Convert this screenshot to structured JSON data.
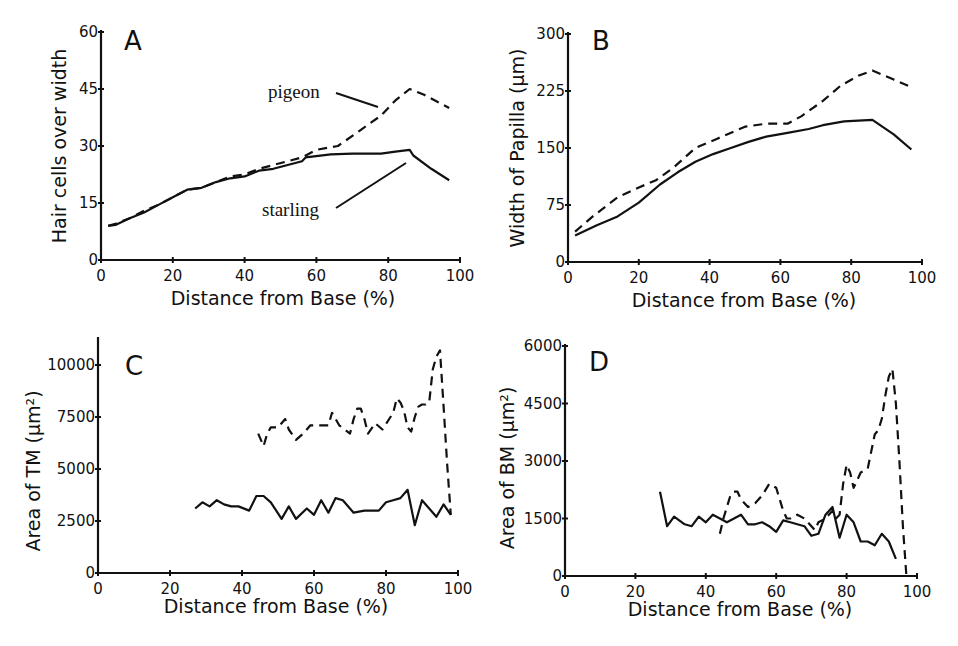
{
  "chart_data": [
    {
      "panel": "A",
      "type": "line",
      "title": "A",
      "xlabel": "Distance from Base (%)",
      "ylabel": "Hair cells over width",
      "xlim": [
        0,
        100
      ],
      "ylim": [
        0,
        60
      ],
      "xticks": [
        0,
        20,
        40,
        60,
        80,
        100
      ],
      "yticks": [
        0,
        15,
        30,
        45,
        60
      ],
      "grid": false,
      "legend": "inline annotations",
      "annotations": [
        "pigeon",
        "starling"
      ],
      "series": [
        {
          "name": "pigeon",
          "style": "dashed",
          "x": [
            2,
            4,
            8,
            12,
            16,
            20,
            24,
            28,
            32,
            36,
            40,
            44,
            48,
            52,
            56,
            60,
            66,
            72,
            78,
            82,
            86,
            90,
            97
          ],
          "y": [
            9,
            9.5,
            11,
            13,
            14.5,
            16.5,
            18.5,
            19,
            20.5,
            22,
            22.5,
            24,
            25,
            26,
            27,
            29,
            30,
            34,
            38,
            42,
            45,
            43.5,
            40
          ]
        },
        {
          "name": "starling",
          "style": "solid",
          "x": [
            2,
            4,
            8,
            12,
            16,
            20,
            24,
            28,
            32,
            36,
            40,
            44,
            48,
            52,
            56,
            57,
            64,
            70,
            78,
            82,
            86,
            87,
            92,
            97
          ],
          "y": [
            9,
            9.2,
            11,
            12.5,
            14.5,
            16.5,
            18.5,
            19,
            20.5,
            21.5,
            22,
            23.5,
            24,
            25,
            26,
            27,
            27.8,
            28,
            28,
            28.5,
            29,
            27.5,
            24,
            21
          ]
        }
      ]
    },
    {
      "panel": "B",
      "type": "line",
      "title": "B",
      "xlabel": "Distance from Base (%)",
      "ylabel": "Width of Papilla (μm)",
      "xlim": [
        0,
        100
      ],
      "ylim": [
        0,
        300
      ],
      "xticks": [
        0,
        20,
        40,
        60,
        80,
        100
      ],
      "yticks": [
        0,
        75,
        150,
        225,
        300
      ],
      "grid": false,
      "series": [
        {
          "name": "pigeon",
          "style": "dashed",
          "x": [
            2,
            7,
            14,
            20,
            25,
            30,
            36,
            42,
            50,
            56,
            62,
            66,
            72,
            77,
            82,
            86,
            92,
            97
          ],
          "y": [
            40,
            60,
            85,
            98,
            108,
            125,
            150,
            162,
            178,
            182,
            182,
            192,
            212,
            232,
            245,
            252,
            240,
            230
          ]
        },
        {
          "name": "starling",
          "style": "solid",
          "x": [
            2,
            8,
            14,
            20,
            26,
            31,
            36,
            41,
            46,
            51,
            56,
            62,
            68,
            72,
            78,
            82,
            86,
            92,
            97
          ],
          "y": [
            35,
            48,
            60,
            78,
            102,
            118,
            132,
            142,
            150,
            158,
            165,
            170,
            175,
            180,
            185,
            186,
            187,
            168,
            148
          ]
        }
      ]
    },
    {
      "panel": "C",
      "type": "line",
      "title": "C",
      "xlabel": "Distance from Base (%)",
      "ylabel": "Area of TM (μm²)",
      "xlim": [
        0,
        100
      ],
      "ylim": [
        0,
        11000
      ],
      "xticks": [
        0,
        20,
        40,
        60,
        80,
        100
      ],
      "yticks": [
        0,
        2500,
        5000,
        7500,
        10000
      ],
      "grid": false,
      "series": [
        {
          "name": "pigeon",
          "style": "dashed",
          "x": [
            44.5,
            46,
            47,
            48,
            50,
            51,
            52,
            53,
            55,
            57,
            59,
            62,
            64,
            65,
            67,
            70,
            71,
            72,
            73,
            74,
            75,
            77,
            79,
            82,
            83,
            84,
            85,
            86,
            87,
            88,
            89,
            90,
            91,
            92,
            93,
            94,
            95,
            96,
            97,
            98
          ],
          "y": [
            6700,
            6100,
            6700,
            7000,
            7000,
            7200,
            7400,
            6900,
            6400,
            6700,
            7100,
            7100,
            7100,
            7700,
            7100,
            6700,
            7400,
            7900,
            7900,
            7400,
            6700,
            7200,
            6900,
            7700,
            8400,
            8200,
            7800,
            7000,
            6800,
            7500,
            8000,
            8100,
            8100,
            8200,
            9800,
            10400,
            10700,
            8000,
            5200,
            2800
          ]
        },
        {
          "name": "starling",
          "style": "solid",
          "x": [
            27,
            29,
            31,
            33,
            35,
            37,
            39,
            42,
            44,
            46,
            48,
            51,
            53,
            55,
            58,
            60,
            62,
            64,
            66,
            68,
            71,
            74,
            76,
            78,
            80,
            82,
            84,
            86,
            88,
            90,
            92,
            94,
            96,
            98
          ],
          "y": [
            3100,
            3400,
            3200,
            3500,
            3300,
            3200,
            3200,
            3000,
            3700,
            3700,
            3400,
            2600,
            3200,
            2600,
            3100,
            2800,
            3500,
            2900,
            3600,
            3500,
            2900,
            3000,
            3000,
            3000,
            3400,
            3500,
            3600,
            4000,
            2300,
            3500,
            3100,
            2700,
            3300,
            2800
          ]
        }
      ]
    },
    {
      "panel": "D",
      "type": "line",
      "title": "D",
      "xlabel": "Distance from Base (%)",
      "ylabel": "Area of BM (μm²)",
      "xlim": [
        0,
        100
      ],
      "ylim": [
        0,
        6000
      ],
      "xticks": [
        0,
        20,
        40,
        60,
        80,
        100
      ],
      "yticks": [
        0,
        1500,
        3000,
        4500,
        6000
      ],
      "grid": false,
      "series": [
        {
          "name": "pigeon",
          "style": "dashed",
          "x": [
            44,
            45,
            46,
            47,
            48,
            49,
            50,
            51,
            52,
            54,
            56,
            58,
            60,
            61,
            62,
            63,
            64,
            66,
            68,
            70,
            71,
            72,
            74,
            76,
            77,
            78,
            79,
            80,
            81,
            82,
            83,
            84,
            86,
            88,
            89,
            90,
            91,
            92,
            93,
            94,
            95,
            96,
            97
          ],
          "y": [
            1100,
            1500,
            1800,
            2100,
            2200,
            2200,
            2000,
            1900,
            1800,
            1900,
            2100,
            2400,
            2300,
            2000,
            1700,
            1500,
            1500,
            1600,
            1500,
            1300,
            1200,
            1400,
            1500,
            1700,
            1500,
            1600,
            2400,
            2900,
            2700,
            2300,
            2500,
            2700,
            2800,
            3700,
            3800,
            4100,
            4700,
            5200,
            5400,
            4500,
            3000,
            1300,
            0
          ]
        },
        {
          "name": "starling",
          "style": "solid",
          "x": [
            27,
            29,
            31,
            34,
            36,
            38,
            40,
            42,
            44,
            46,
            48,
            50,
            52,
            54,
            56,
            58,
            60,
            62,
            64,
            66,
            68,
            70,
            72,
            74,
            76,
            78,
            80,
            82,
            84,
            86,
            88,
            90,
            92,
            94
          ],
          "y": [
            2200,
            1300,
            1550,
            1350,
            1300,
            1550,
            1400,
            1600,
            1500,
            1400,
            1500,
            1600,
            1350,
            1350,
            1400,
            1300,
            1150,
            1450,
            1400,
            1350,
            1300,
            1050,
            1100,
            1600,
            1800,
            1000,
            1600,
            1400,
            900,
            900,
            800,
            1100,
            900,
            450
          ]
        }
      ]
    }
  ],
  "panels": {
    "A": {
      "letter": "A",
      "ylabel": "Hair cells over width",
      "xlabel": "Distance from Base (%)",
      "pigeon_label": "pigeon",
      "starling_label": "starling"
    },
    "B": {
      "letter": "B",
      "ylabel": "Width of Papilla (μm)",
      "xlabel": "Distance from Base (%)"
    },
    "C": {
      "letter": "C",
      "ylabel": "Area of TM (μm²)",
      "xlabel": "Distance from Base (%)"
    },
    "D": {
      "letter": "D",
      "ylabel": "Area of BM (μm²)",
      "xlabel": "Distance from Base (%)"
    }
  },
  "colors": {
    "ink": "#111111",
    "background": "#ffffff"
  }
}
